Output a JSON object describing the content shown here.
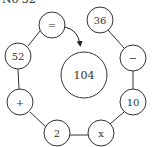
{
  "heading": "No 32",
  "center": {
    "value": "104"
  },
  "ring": [
    {
      "label": "=",
      "cx": 52,
      "cy": 25
    },
    {
      "label": "36",
      "cx": 100,
      "cy": 20
    },
    {
      "label": "−",
      "cx": 133,
      "cy": 58
    },
    {
      "label": "10",
      "cx": 133,
      "cy": 102
    },
    {
      "label": "x",
      "cx": 101,
      "cy": 133
    },
    {
      "label": "2",
      "cx": 57,
      "cy": 133
    },
    {
      "label": "+",
      "cx": 20,
      "cy": 102
    },
    {
      "label": "52",
      "cx": 18,
      "cy": 56
    }
  ],
  "colors": {
    "stroke": "#333333",
    "fill": "#ffffff"
  }
}
